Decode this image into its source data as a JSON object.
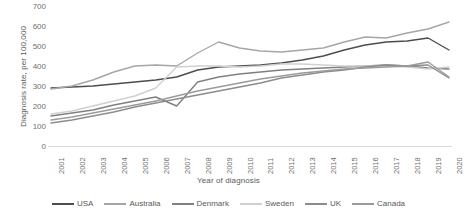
{
  "chart_data": {
    "type": "line",
    "title": "",
    "xlabel": "Year of diagnosis",
    "ylabel": "Diagnosis rate, per 100,000",
    "grid": false,
    "legend_position": "bottom",
    "xlim": [
      2001,
      2020
    ],
    "ylim": [
      0,
      700
    ],
    "y_ticks": [
      0,
      100,
      200,
      300,
      400,
      500,
      600,
      700
    ],
    "categories": [
      "2001",
      "2002",
      "2003",
      "2004",
      "2005",
      "2006",
      "2007",
      "2008",
      "2009",
      "2010",
      "2011",
      "2012",
      "2013",
      "2014",
      "2015",
      "2016",
      "2017",
      "2018",
      "2019",
      "2020"
    ],
    "series": [
      {
        "name": "USA",
        "color": "#4d4d4d",
        "values": [
          290,
          295,
          300,
          310,
          320,
          330,
          345,
          380,
          395,
          400,
          405,
          415,
          430,
          450,
          480,
          505,
          520,
          525,
          540,
          480
        ]
      },
      {
        "name": "Australia",
        "color": "#a6a6a6",
        "values": [
          285,
          300,
          330,
          370,
          400,
          405,
          400,
          465,
          520,
          490,
          475,
          470,
          480,
          490,
          520,
          545,
          540,
          565,
          585,
          620
        ]
      },
      {
        "name": "Denmark",
        "color": "#808080",
        "values": [
          150,
          165,
          180,
          205,
          225,
          245,
          200,
          320,
          345,
          360,
          370,
          380,
          385,
          390,
          395,
          400,
          405,
          400,
          390,
          385
        ]
      },
      {
        "name": "Sweden",
        "color": "#d0d0d0",
        "values": [
          160,
          175,
          200,
          225,
          250,
          290,
          395,
          400,
          400,
          395,
          400,
          410,
          410,
          405,
          400,
          400,
          400,
          395,
          385,
          395
        ]
      },
      {
        "name": "UK",
        "color": "#8c8c8c",
        "values": [
          115,
          130,
          150,
          170,
          195,
          215,
          235,
          255,
          275,
          295,
          315,
          340,
          355,
          370,
          380,
          395,
          405,
          400,
          405,
          340
        ]
      },
      {
        "name": "Canada",
        "color": "#9b9b9b",
        "values": [
          130,
          145,
          165,
          185,
          205,
          225,
          250,
          275,
          295,
          315,
          335,
          350,
          365,
          375,
          385,
          390,
          395,
          400,
          420,
          345
        ]
      }
    ]
  },
  "axes": {
    "y_title": "Diagnosis rate, per 100,000",
    "x_title": "Year of diagnosis"
  }
}
